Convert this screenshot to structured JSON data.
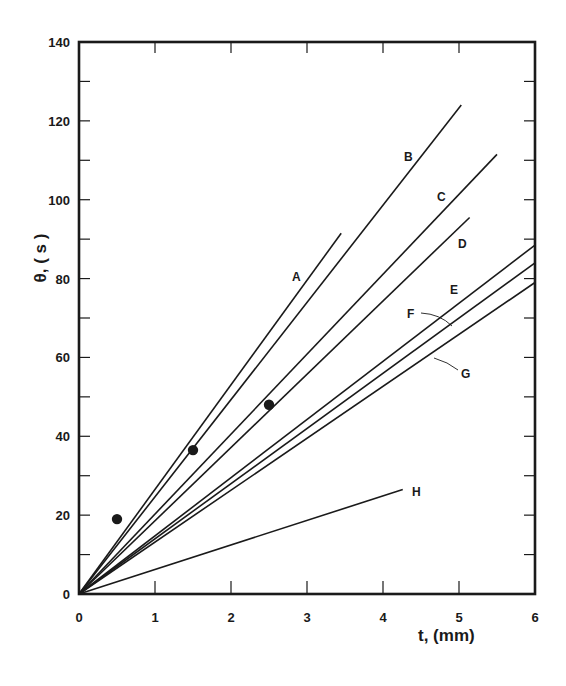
{
  "chart_data": {
    "type": "line",
    "title": "",
    "xlabel": "t, (mm)",
    "ylabel": "θ, (s)",
    "xlim": [
      0,
      6
    ],
    "ylim": [
      0,
      140
    ],
    "x_ticks": [
      0,
      1,
      2,
      3,
      4,
      5,
      6
    ],
    "y_ticks": [
      0,
      20,
      40,
      60,
      80,
      100,
      120,
      140
    ],
    "y_minor_step": 10,
    "grid": false,
    "legend": "inline labels next to each line",
    "series": [
      {
        "name": "A",
        "x": [
          0,
          3.45
        ],
        "values": [
          0,
          91.5
        ]
      },
      {
        "name": "B",
        "x": [
          0,
          5.03
        ],
        "values": [
          0,
          124
        ]
      },
      {
        "name": "C",
        "x": [
          0,
          5.5
        ],
        "values": [
          0,
          111.5
        ]
      },
      {
        "name": "D",
        "x": [
          0,
          5.14
        ],
        "values": [
          0,
          95.5
        ]
      },
      {
        "name": "E",
        "x": [
          0,
          6
        ],
        "values": [
          0,
          88.5
        ]
      },
      {
        "name": "F",
        "x": [
          0,
          6
        ],
        "values": [
          0,
          84
        ]
      },
      {
        "name": "G",
        "x": [
          0,
          6
        ],
        "values": [
          0,
          79
        ]
      },
      {
        "name": "H",
        "x": [
          0,
          4.26
        ],
        "values": [
          0,
          26.5
        ]
      }
    ],
    "scatter_points": {
      "name": "measured",
      "x": [
        0.5,
        1.5,
        2.5
      ],
      "values": [
        19,
        36.5,
        48
      ]
    }
  },
  "labels": {
    "x_axis_title": "t,  (mm)",
    "y_axis_title": "θ, ( s )",
    "x_tick_labels": [
      "0",
      "1",
      "2",
      "3",
      "4",
      "5",
      "6"
    ],
    "y_tick_labels": [
      "0",
      "20",
      "40",
      "60",
      "80",
      "100",
      "120",
      "140"
    ],
    "line_labels": [
      "A",
      "B",
      "C",
      "D",
      "E",
      "F",
      "G",
      "H"
    ]
  },
  "colors": {
    "ink": "#1a1a1a",
    "background": "#ffffff"
  }
}
